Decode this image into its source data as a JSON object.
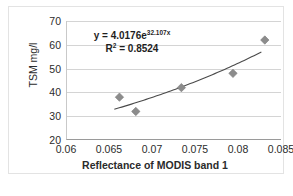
{
  "chart_data": {
    "type": "scatter",
    "title": "",
    "xlabel": "Reflectance of MODIS band 1",
    "ylabel": "TSM mg/l",
    "xlim": [
      0.06,
      0.085
    ],
    "ylim": [
      20,
      70
    ],
    "xticks": [
      "0.06",
      "0.065",
      "0.07",
      "0.075",
      "0.08",
      "0.085"
    ],
    "xtick_values": [
      0.06,
      0.065,
      0.07,
      0.075,
      0.08,
      0.085
    ],
    "yticks": [
      "20",
      "30",
      "40",
      "50",
      "60",
      "70"
    ],
    "ytick_values": [
      20,
      30,
      40,
      50,
      60,
      70
    ],
    "grid": "horizontal",
    "legend": "none",
    "x": [
      0.0661,
      0.068,
      0.0733,
      0.0793,
      0.083
    ],
    "y": [
      38,
      32,
      42,
      48,
      62
    ],
    "points": [
      {
        "x": 0.0661,
        "y": 38
      },
      {
        "x": 0.068,
        "y": 32
      },
      {
        "x": 0.0733,
        "y": 42
      },
      {
        "x": 0.0793,
        "y": 48
      },
      {
        "x": 0.083,
        "y": 62
      }
    ],
    "trendline": {
      "type": "exponential",
      "coefficient": 4.0176,
      "exponent_rate": 32.107,
      "r_squared": 0.8524,
      "x_start": 0.0655,
      "x_end": 0.0826
    },
    "annotations": {
      "equation_prefix": "y = 4.0176e",
      "equation_exponent": "32.107x",
      "r2_prefix": "R",
      "r2_superscript": "2",
      "r2_value": " = 0.8524"
    }
  },
  "colors": {
    "marker": "#8c8c8c",
    "trendline": "#4a4a4a",
    "gridline": "#d4d4d4",
    "axis": "#9a9a9a",
    "text": "#2b2b2b",
    "frame": "#e3e3e3",
    "background": "#ffffff"
  }
}
